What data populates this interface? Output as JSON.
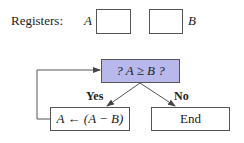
{
  "registers": {
    "label": "Registers:",
    "a_name": "A",
    "b_name": "B"
  },
  "flowchart": {
    "decision": "? A ≥ B ?",
    "decision_fill": "#b8b8ec",
    "yes_label": "Yes",
    "no_label": "No",
    "action": "A ← (A − B)",
    "end": "End"
  }
}
